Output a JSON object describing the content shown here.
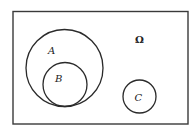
{
  "diagram": {
    "type": "venn",
    "universe": {
      "label": "Ω"
    },
    "sets": [
      {
        "id": "A",
        "label": "A"
      },
      {
        "id": "B",
        "label": "B",
        "subset_of": "A"
      },
      {
        "id": "C",
        "label": "C",
        "disjoint_from": [
          "A",
          "B"
        ]
      }
    ],
    "colors": {
      "stroke": "#2a2a2a",
      "background": "#ffffff"
    }
  }
}
